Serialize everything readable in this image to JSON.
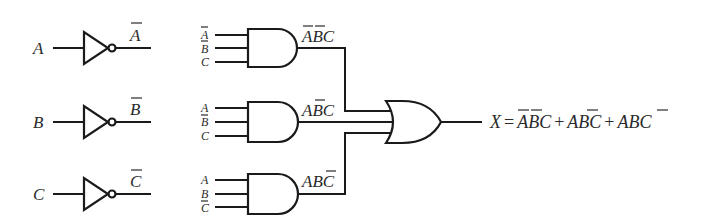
{
  "diagram": {
    "type": "logic-circuit",
    "inverters": [
      {
        "input": "A",
        "output": "A",
        "output_negated": true
      },
      {
        "input": "B",
        "output": "B",
        "output_negated": true
      },
      {
        "input": "C",
        "output": "C",
        "output_negated": true
      }
    ],
    "and_gates": [
      {
        "inputs": [
          {
            "name": "A",
            "neg": true
          },
          {
            "name": "B",
            "neg": true
          },
          {
            "name": "C",
            "neg": false
          }
        ],
        "output_terms": [
          {
            "t": "A",
            "neg": true
          },
          {
            "t": "B",
            "neg": true
          },
          {
            "t": "C",
            "neg": false
          }
        ]
      },
      {
        "inputs": [
          {
            "name": "A",
            "neg": false
          },
          {
            "name": "B",
            "neg": true
          },
          {
            "name": "C",
            "neg": false
          }
        ],
        "output_terms": [
          {
            "t": "A",
            "neg": false
          },
          {
            "t": "B",
            "neg": true
          },
          {
            "t": "C",
            "neg": false
          }
        ]
      },
      {
        "inputs": [
          {
            "name": "A",
            "neg": false
          },
          {
            "name": "B",
            "neg": false
          },
          {
            "name": "C",
            "neg": true
          }
        ],
        "output_terms": [
          {
            "t": "A",
            "neg": false
          },
          {
            "t": "B",
            "neg": false
          },
          {
            "t": "C",
            "neg": true
          }
        ]
      }
    ],
    "or_gate": {
      "inputs": 3
    },
    "output_equation": {
      "lhs": "X",
      "equals": "=",
      "plus": "+",
      "terms": [
        [
          {
            "t": "A",
            "neg": true
          },
          {
            "t": "B",
            "neg": true
          },
          {
            "t": "C",
            "neg": false
          }
        ],
        [
          {
            "t": "A",
            "neg": false
          },
          {
            "t": "B",
            "neg": true
          },
          {
            "t": "C",
            "neg": false
          }
        ],
        [
          {
            "t": "A",
            "neg": false
          },
          {
            "t": "B",
            "neg": false
          },
          {
            "t": "C",
            "neg": true
          }
        ]
      ],
      "text": "X = A'B'C + AB'C + ABC'"
    },
    "labels": {
      "inv_in_a": "A",
      "inv_in_b": "B",
      "inv_in_c": "C",
      "inv_out_a": "A",
      "inv_out_b": "B",
      "inv_out_c": "C",
      "g1_in1": "A",
      "g1_in2": "B",
      "g1_in3": "C",
      "g2_in1": "A",
      "g2_in2": "B",
      "g2_in3": "C",
      "g3_in1": "A",
      "g3_in2": "B",
      "g3_in3": "C",
      "g1_out_1": "A",
      "g1_out_2": "B",
      "g1_out_3": "C",
      "g2_out_1": "A",
      "g2_out_2": "B",
      "g2_out_3": "C",
      "g3_out_1": "A",
      "g3_out_2": "B",
      "g3_out_3": "C",
      "eq_x": "X",
      "eq_eq": "=",
      "eq_plus": "+",
      "eq_t1_a": "A",
      "eq_t1_b": "B",
      "eq_t1_c": "C",
      "eq_t2_a": "A",
      "eq_t2_b": "B",
      "eq_t2_c": "C",
      "eq_t3_a": "A",
      "eq_t3_b": "B",
      "eq_t3_c": "C"
    }
  }
}
